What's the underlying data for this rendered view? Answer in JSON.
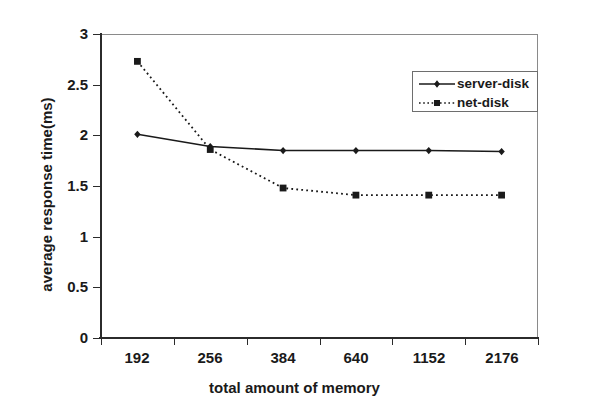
{
  "chart_data": {
    "type": "line",
    "title": "",
    "xlabel": "total amount of memory",
    "ylabel": "average response time(ms)",
    "categories": [
      "192",
      "256",
      "384",
      "640",
      "1152",
      "2176"
    ],
    "ylim": [
      0,
      3
    ],
    "yticks": [
      "0",
      "0.5",
      "1",
      "1.5",
      "2",
      "2.5",
      "3"
    ],
    "ytick_values": [
      0,
      0.5,
      1,
      1.5,
      2,
      2.5,
      3
    ],
    "grid": false,
    "legend_position": "upper right inside",
    "series": [
      {
        "name": "server-disk",
        "values": [
          2.01,
          1.89,
          1.85,
          1.85,
          1.85,
          1.84
        ],
        "line_style": "solid",
        "marker": "diamond",
        "color": "#1a1a1a"
      },
      {
        "name": "net-disk",
        "values": [
          2.73,
          1.86,
          1.48,
          1.41,
          1.41,
          1.41
        ],
        "line_style": "dotted",
        "marker": "square",
        "color": "#1a1a1a"
      }
    ]
  },
  "legend": {
    "items": [
      {
        "label": "server-disk"
      },
      {
        "label": "net-disk"
      }
    ]
  },
  "colors": {
    "background": "#ffffff",
    "axis": "#2b2b2b",
    "frame": "#8a8a8a",
    "series": "#1a1a1a"
  }
}
